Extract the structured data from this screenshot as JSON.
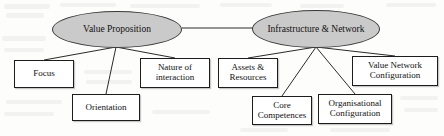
{
  "diagram": {
    "type": "hierarchy-tree",
    "colors": {
      "ellipse_fill": "#cacaca",
      "ellipse_stroke": "#3a3a3a",
      "box_fill": "#ffffff",
      "box_stroke": "#1d1d1d",
      "line": "#2a2a2a",
      "page_background": "#fdfdfc"
    },
    "roots": [
      {
        "id": "value-proposition",
        "label": "Value Proposition",
        "shape": "ellipse",
        "x": 52,
        "y": 11,
        "w": 130,
        "h": 37
      },
      {
        "id": "infrastructure-network",
        "label": "Infrastructure & Network",
        "shape": "ellipse",
        "x": 252,
        "y": 10,
        "w": 128,
        "h": 38
      }
    ],
    "leaves": [
      {
        "id": "focus",
        "label": "Focus",
        "parent": "value-proposition",
        "x": 14,
        "y": 60,
        "w": 60,
        "h": 28
      },
      {
        "id": "orientation",
        "label": "Orientation",
        "parent": "value-proposition",
        "x": 72,
        "y": 94,
        "w": 68,
        "h": 27
      },
      {
        "id": "nature-of-interaction",
        "label": "Nature of interaction",
        "parent": "value-proposition",
        "x": 140,
        "y": 58,
        "w": 70,
        "h": 30
      },
      {
        "id": "assets-resources",
        "label": "Assets & Resources",
        "parent": "infrastructure-network",
        "x": 218,
        "y": 58,
        "w": 60,
        "h": 30
      },
      {
        "id": "core-competences",
        "label": "Core Competences",
        "parent": "infrastructure-network",
        "x": 252,
        "y": 96,
        "w": 60,
        "h": 29
      },
      {
        "id": "organisational-configuration",
        "label": "Organisational Configuration",
        "parent": "infrastructure-network",
        "x": 318,
        "y": 94,
        "w": 74,
        "h": 30
      },
      {
        "id": "value-network-configuration",
        "label": "Value Network Configuration",
        "parent": "infrastructure-network",
        "x": 352,
        "y": 56,
        "w": 86,
        "h": 30
      }
    ],
    "connectors": [
      {
        "from": "value-proposition",
        "to": "infrastructure-network",
        "x1": 182,
        "y1": 28,
        "x2": 253,
        "y2": 28
      },
      {
        "from": "value-proposition",
        "to": "focus",
        "x1": 116,
        "y1": 47,
        "x2": 44,
        "y2": 60
      },
      {
        "from": "value-proposition",
        "to": "orientation",
        "x1": 116,
        "y1": 47,
        "x2": 106,
        "y2": 94
      },
      {
        "from": "value-proposition",
        "to": "nature-of-interaction",
        "x1": 116,
        "y1": 47,
        "x2": 175,
        "y2": 58
      },
      {
        "from": "infrastructure-network",
        "to": "assets-resources",
        "x1": 316,
        "y1": 47,
        "x2": 248,
        "y2": 58
      },
      {
        "from": "infrastructure-network",
        "to": "core-competences",
        "x1": 316,
        "y1": 47,
        "x2": 282,
        "y2": 96
      },
      {
        "from": "infrastructure-network",
        "to": "organisational-configuration",
        "x1": 316,
        "y1": 47,
        "x2": 355,
        "y2": 94
      },
      {
        "from": "infrastructure-network",
        "to": "value-network-configuration",
        "x1": 316,
        "y1": 47,
        "x2": 395,
        "y2": 56
      }
    ]
  }
}
